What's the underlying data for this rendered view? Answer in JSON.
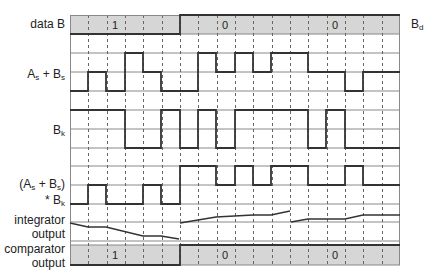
{
  "diagram": {
    "title": "",
    "frame": {
      "x0": 70,
      "x1": 400,
      "columns": 18
    },
    "colors": {
      "band_fill": "#d6d6d6",
      "line": "#333333",
      "grid": "#888888",
      "dash": "#666666"
    },
    "labels": {
      "data_b": "data B",
      "bd_main": "B",
      "bd_sub": "d",
      "asbs_a": "A",
      "asbs_a_sub": "s",
      "asbs_plus": " + B",
      "asbs_b_sub": "s",
      "bk_main": "B",
      "bk_sub": "k",
      "prod_l1_a": "(A",
      "prod_l1_a_sub": "s",
      "prod_l1_b": " + B",
      "prod_l1_b_sub": "s",
      "prod_l1_c": ")",
      "prod_l2_a": "* B",
      "prod_l2_sub": "k",
      "integrator_l1": "integrator",
      "integrator_l2": "output",
      "comparator_l1": "comparator",
      "comparator_l2": "output"
    },
    "data_b_band": {
      "y_top": 15,
      "y_bot": 34,
      "bits": [
        {
          "value": "1",
          "x0": 70,
          "x1": 180,
          "text_x": 115
        },
        {
          "value": "0",
          "x0": 180,
          "x1": 290,
          "text_x": 225
        },
        {
          "value": "0",
          "x0": 290,
          "x1": 400,
          "text_x": 335
        }
      ]
    },
    "comparator_band": {
      "y_top": 245,
      "y_bot": 265,
      "bits": [
        {
          "value": "1",
          "x0": 70,
          "x1": 180,
          "text_x": 115
        },
        {
          "value": "0",
          "x0": 180,
          "x1": 290,
          "text_x": 225
        },
        {
          "value": "0",
          "x0": 290,
          "x1": 400,
          "text_x": 335
        }
      ]
    },
    "hlines": [
      34,
      53,
      72,
      91,
      110,
      129,
      148,
      166,
      185,
      204,
      222,
      241,
      245
    ],
    "waveforms": {
      "as_plus_bs": {
        "levels": {
          "high": 53,
          "mid": 72,
          "low": 91
        },
        "steps": [
          [
            70,
            "low"
          ],
          [
            88,
            "mid"
          ],
          [
            106,
            "low"
          ],
          [
            125,
            "high"
          ],
          [
            143,
            "mid"
          ],
          [
            161,
            "low"
          ],
          [
            198,
            "high"
          ],
          [
            216,
            "mid"
          ],
          [
            235,
            "high"
          ],
          [
            253,
            "mid"
          ],
          [
            271,
            "high"
          ],
          [
            308,
            "mid"
          ],
          [
            345,
            "low"
          ],
          [
            363,
            "mid"
          ],
          [
            400,
            "mid"
          ]
        ]
      },
      "bk": {
        "levels": {
          "high": 110,
          "low": 148
        },
        "steps": [
          [
            70,
            "high"
          ],
          [
            125,
            "low"
          ],
          [
            161,
            "high"
          ],
          [
            180,
            "low"
          ],
          [
            198,
            "high"
          ],
          [
            216,
            "low"
          ],
          [
            235,
            "high"
          ],
          [
            308,
            "low"
          ],
          [
            326,
            "high"
          ],
          [
            345,
            "low"
          ],
          [
            400,
            "low"
          ]
        ]
      },
      "product": {
        "levels": {
          "high": 166,
          "mid": 185,
          "low": 204
        },
        "steps": [
          [
            70,
            "low"
          ],
          [
            88,
            "mid"
          ],
          [
            106,
            "low"
          ],
          [
            143,
            "mid"
          ],
          [
            161,
            "low"
          ],
          [
            180,
            "high"
          ],
          [
            216,
            "mid"
          ],
          [
            235,
            "high"
          ],
          [
            253,
            "mid"
          ],
          [
            271,
            "high"
          ],
          [
            308,
            "mid"
          ],
          [
            345,
            "high"
          ],
          [
            363,
            "mid"
          ],
          [
            400,
            "mid"
          ]
        ]
      },
      "integrator": {
        "segments": [
          [
            [
              70,
              223
            ],
            [
              88,
              227
            ],
            [
              106,
              227
            ],
            [
              143,
              236
            ],
            [
              161,
              236
            ],
            [
              179,
              239
            ]
          ],
          [
            [
              180,
              223
            ],
            [
              216,
              217
            ],
            [
              253,
              215
            ],
            [
              271,
              215
            ],
            [
              290,
              211
            ]
          ],
          [
            [
              291,
              222
            ],
            [
              308,
              219
            ],
            [
              345,
              219
            ],
            [
              363,
              215
            ],
            [
              400,
              215
            ]
          ]
        ]
      }
    }
  }
}
